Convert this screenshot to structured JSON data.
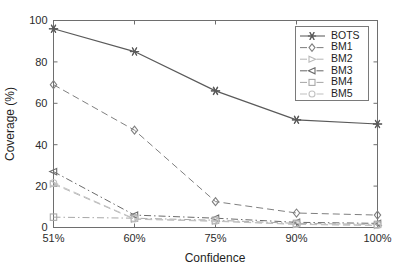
{
  "chart_data": {
    "type": "line",
    "title": "",
    "xlabel": "Confidence",
    "ylabel": "Coverage (%)",
    "categories": [
      "51%",
      "60%",
      "75%",
      "90%",
      "100%"
    ],
    "x_tick_labels": [
      "51%",
      "60%",
      "75%",
      "90%",
      "100%"
    ],
    "y_tick_labels": [
      "0",
      "20",
      "40",
      "60",
      "80",
      "100"
    ],
    "y_ticks": [
      0,
      20,
      40,
      60,
      80,
      100
    ],
    "ylim": [
      0,
      100
    ],
    "grid": false,
    "legend_position": "upper right",
    "series": [
      {
        "name": "BOTS",
        "values": [
          96,
          85,
          66,
          52,
          50
        ],
        "marker": "star-marker",
        "dash": "none",
        "color": "#5a5a5a"
      },
      {
        "name": "BM1",
        "values": [
          69,
          47,
          12.5,
          7,
          6
        ],
        "marker": "diamond-marker",
        "dash": "dashed",
        "color": "#808080"
      },
      {
        "name": "BM2",
        "values": [
          21,
          4,
          3,
          1.5,
          1
        ],
        "marker": "triangle-right-marker",
        "dash": "dashed",
        "color": "#b8b8b8"
      },
      {
        "name": "BM3",
        "values": [
          27,
          6,
          4.5,
          2.5,
          2
        ],
        "marker": "triangle-left-marker",
        "dash": "dash-dot",
        "color": "#6b6b6b"
      },
      {
        "name": "BM4",
        "values": [
          5,
          4.5,
          3.5,
          2,
          1.5
        ],
        "marker": "square-marker",
        "dash": "dash-dot",
        "color": "#a8a8a8"
      },
      {
        "name": "BM5",
        "values": [
          21.5,
          4.2,
          3.2,
          1.6,
          1.1
        ],
        "marker": "circle-marker",
        "dash": "dashed",
        "color": "#c2c2c2"
      }
    ]
  },
  "axes": {
    "x_title": "Confidence",
    "y_title": "Coverage (%)"
  },
  "legend": {
    "entries": [
      {
        "label": "BOTS",
        "marker": "star-marker"
      },
      {
        "label": "BM1",
        "marker": "diamond-marker"
      },
      {
        "label": "BM2",
        "marker": "triangle-right-marker"
      },
      {
        "label": "BM3",
        "marker": "triangle-left-marker"
      },
      {
        "label": "BM4",
        "marker": "square-marker"
      },
      {
        "label": "BM5",
        "marker": "circle-marker"
      }
    ]
  }
}
